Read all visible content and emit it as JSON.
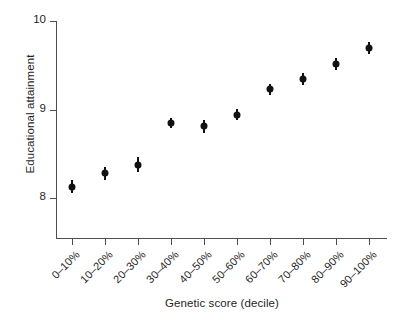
{
  "chart_data": {
    "type": "scatter",
    "title": "",
    "xlabel": "Genetic score (decile)",
    "ylabel": "Educational attainment",
    "categories": [
      "0–10%",
      "10–20%",
      "20–30%",
      "30–40%",
      "40–50%",
      "50–60%",
      "60–70%",
      "70–80%",
      "80–90%",
      "90–100%"
    ],
    "values": [
      8.13,
      8.28,
      8.37,
      8.85,
      8.81,
      8.94,
      9.23,
      9.34,
      9.51,
      9.69
    ],
    "error_low": [
      8.06,
      8.21,
      8.29,
      8.79,
      8.74,
      8.88,
      9.17,
      9.28,
      9.45,
      9.63
    ],
    "error_high": [
      8.2,
      8.35,
      8.46,
      8.91,
      8.88,
      9.01,
      9.29,
      9.41,
      9.58,
      9.76
    ],
    "ylim": [
      7.55,
      10.0
    ],
    "yticks": [
      8,
      9,
      10
    ],
    "ytick_labels": [
      "8",
      "9",
      "10"
    ],
    "grid": false,
    "legend": "none",
    "marker": "filled-circle",
    "marker_color": "#111111",
    "errorbar_color": "#111111",
    "axis_color": "#4f4f4f",
    "background": "#ffffff"
  },
  "axes": {
    "y_title": "Educational attainment",
    "x_title": "Genetic score (decile)"
  }
}
